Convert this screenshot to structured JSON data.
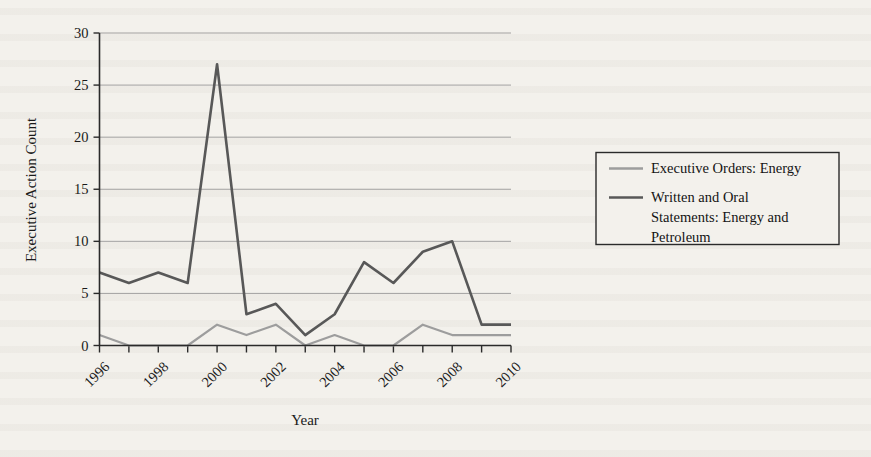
{
  "chart_data": {
    "type": "line",
    "title": "",
    "xlabel": "Year",
    "ylabel": "Executive Action Count",
    "x": [
      1996,
      1997,
      1998,
      1999,
      2000,
      2001,
      2002,
      2003,
      2004,
      2005,
      2006,
      2007,
      2008,
      2009,
      2010
    ],
    "xtick_labels": [
      "1996",
      "1998",
      "2000",
      "2002",
      "2004",
      "2006",
      "2008",
      "2010"
    ],
    "xtick_values": [
      1996,
      1998,
      2000,
      2002,
      2004,
      2006,
      2008,
      2010
    ],
    "ytick_labels": [
      "0",
      "5",
      "10",
      "15",
      "20",
      "25",
      "30"
    ],
    "ytick_values": [
      0,
      5,
      10,
      15,
      20,
      25,
      30
    ],
    "xlim": [
      1996,
      2010
    ],
    "ylim": [
      0,
      30
    ],
    "grid": "horizontal",
    "legend_position": "right-outside",
    "series": [
      {
        "name": "Executive Orders: Energy",
        "color": "#9d9d9d",
        "values": [
          1,
          0,
          0,
          0,
          2,
          1,
          2,
          0,
          1,
          0,
          0,
          2,
          1,
          1,
          1
        ]
      },
      {
        "name": "Written and Oral Statements: Energy and Petroleum",
        "color": "#585858",
        "values": [
          7,
          6,
          7,
          6,
          27,
          3,
          4,
          1,
          3,
          8,
          6,
          9,
          10,
          2,
          2
        ]
      }
    ]
  },
  "legend": {
    "entries": [
      {
        "label": "Executive Orders: Energy"
      },
      {
        "label": "Written and Oral Statements: Energy and Petroleum"
      }
    ],
    "entry_lines": [
      [
        "Executive Orders: Energy"
      ],
      [
        "Written and Oral",
        "Statements: Energy and",
        "Petroleum"
      ]
    ]
  }
}
